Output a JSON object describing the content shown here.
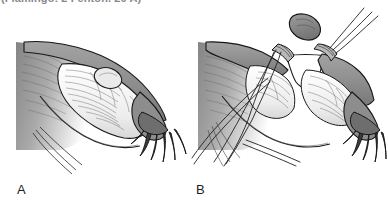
{
  "figure": {
    "caption_truncated": "(Flamingo: 2 Fenton. 20 A)",
    "background_color": "#ffffff",
    "width": 388,
    "height": 208
  },
  "panels": [
    {
      "id": "A",
      "label": "A",
      "name": "panel-a",
      "description": "Intact fallopian tube with distended ampullary segment containing an ovoid gestational mass, broad ligament shown as shaded wedge at left, fimbriae at distal end"
    },
    {
      "id": "B",
      "label": "B",
      "name": "panel-b",
      "description": "Same tube after segmental resection: two ligature bands flank the excised gap, the removed tube segment lies above, suture strands trail down and cross below"
    }
  ],
  "colors": {
    "outline": "#1a1a1a",
    "tissue_mid_gray": "#8c8c8c",
    "tissue_light_gray": "#c9c9c9",
    "tissue_pale": "#e2e2e2",
    "lumen_white": "#fdfdfd",
    "ligament_shade": "#9a9a9a",
    "label_text": "#1d1d1d",
    "caption_text": "#5d626b"
  },
  "elements": {
    "excised_segment": "excised-tube-segment",
    "ligature_left": "ligature-band-left",
    "ligature_right": "ligature-band-right",
    "ovum_mass": "gestational-mass",
    "fimbriae_a": "fimbriae-panel-a",
    "fimbriae_b": "fimbriae-panel-b",
    "suture_threads": "suture-threads"
  }
}
